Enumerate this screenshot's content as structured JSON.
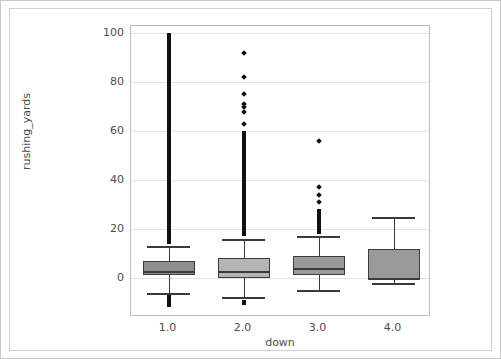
{
  "chart_data": {
    "type": "box",
    "title": "",
    "xlabel": "down",
    "ylabel": "rushing_yards",
    "categories": [
      "1.0",
      "2.0",
      "3.0",
      "4.0"
    ],
    "xtick_labels": [
      "1.0",
      "2.0",
      "3.0",
      "4.0"
    ],
    "ytick_labels": [
      "0",
      "20",
      "40",
      "60",
      "80",
      "100"
    ],
    "ytick_values": [
      0,
      20,
      40,
      60,
      80,
      100
    ],
    "ylim": [
      -16,
      103
    ],
    "xlim": [
      0.5,
      4.5
    ],
    "grid": true,
    "grid_axis": "y",
    "legend": "none",
    "box_facecolor": "#9a9a9a",
    "box_edgecolor": "#3b3b3b",
    "flier_color": "#111111",
    "background": "#ffffff",
    "boxes": [
      {
        "category": "1.0",
        "facecolor": "#8e8e8e",
        "whisker_low": -6,
        "q1": 1,
        "median": 3,
        "q3": 7,
        "whisker_high": 13,
        "flier_bands": [
          {
            "from": 14,
            "to": 100
          },
          {
            "from": -12,
            "to": -7
          }
        ],
        "fliers": []
      },
      {
        "category": "2.0",
        "facecolor": "#b5b5b5",
        "whisker_low": -8,
        "q1": 0,
        "median": 3,
        "q3": 8,
        "whisker_high": 16,
        "flier_bands": [
          {
            "from": 17,
            "to": 60
          },
          {
            "from": -11,
            "to": -9
          }
        ],
        "fliers": [
          63,
          68,
          70,
          71,
          75,
          82,
          92
        ]
      },
      {
        "category": "3.0",
        "facecolor": "#9a9a9a",
        "whisker_low": -5,
        "q1": 1,
        "median": 4,
        "q3": 9,
        "whisker_high": 17,
        "flier_bands": [
          {
            "from": 18,
            "to": 28
          }
        ],
        "fliers": [
          31,
          34,
          37,
          56
        ]
      },
      {
        "category": "4.0",
        "facecolor": "#9a9a9a",
        "whisker_low": -2,
        "q1": -1,
        "median": 0,
        "q3": 12,
        "whisker_high": 25,
        "flier_bands": [],
        "fliers": []
      }
    ]
  }
}
